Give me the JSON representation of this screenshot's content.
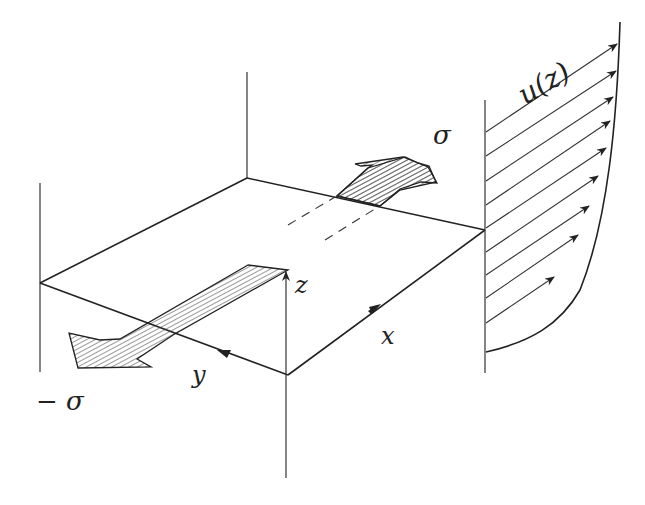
{
  "diagram": {
    "type": "shear-flow-schematic",
    "labels": {
      "sigma_top": "σ",
      "sigma_bottom": "− σ",
      "velocity_profile": "u(z)",
      "axis_x": "x",
      "axis_y": "y",
      "axis_z": "z"
    },
    "colors": {
      "line": "#222222",
      "background": "#ffffff",
      "hatch": "#333333"
    },
    "profile_arrow_count": 11
  }
}
